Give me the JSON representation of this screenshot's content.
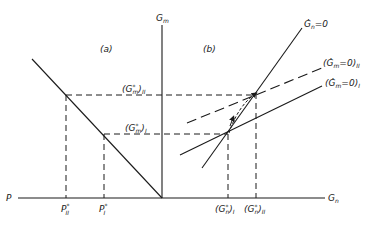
{
  "panels": {
    "a": {
      "label": "(a)"
    },
    "b": {
      "label": "(b)"
    }
  },
  "axes": {
    "vertical": {
      "label": "G",
      "sub": "m"
    },
    "horizontal_right": {
      "label": "G",
      "sub": "n"
    },
    "horizontal_left": {
      "label": "P"
    }
  },
  "curves": {
    "gn_dot_zero": {
      "label": "Ġ",
      "sub": "n",
      "suffix": "=0"
    },
    "gm_dot_zero_II": {
      "prefix": "(Ġ",
      "sub": "m",
      "suffix": "=0)",
      "roman": "II"
    },
    "gm_dot_zero_I": {
      "prefix": "(Ġ",
      "sub": "m",
      "suffix": "=0)",
      "roman": "I"
    }
  },
  "levels": {
    "gm_star_II": {
      "prefix": "(G",
      "sub": "m",
      "sup": "*",
      "suffix": ")",
      "roman": "II"
    },
    "gm_star_I": {
      "prefix": "(G",
      "sub": "m",
      "sup": "*",
      "suffix": ")",
      "roman": "I"
    },
    "gn_star_I": {
      "prefix": "(G",
      "sub": "n",
      "sup": "*",
      "suffix": ")",
      "roman": "I"
    },
    "gn_star_II": {
      "prefix": "(G",
      "sub": "n",
      "sup": "*",
      "suffix": ")",
      "roman": "II"
    },
    "p_star_II": {
      "label": "P",
      "sup": "*",
      "roman": "II"
    },
    "p_star_I": {
      "label": "P",
      "sup": "*",
      "roman": "I"
    }
  },
  "colors": {
    "ink": "#1a1a1a",
    "background": "#ffffff"
  }
}
